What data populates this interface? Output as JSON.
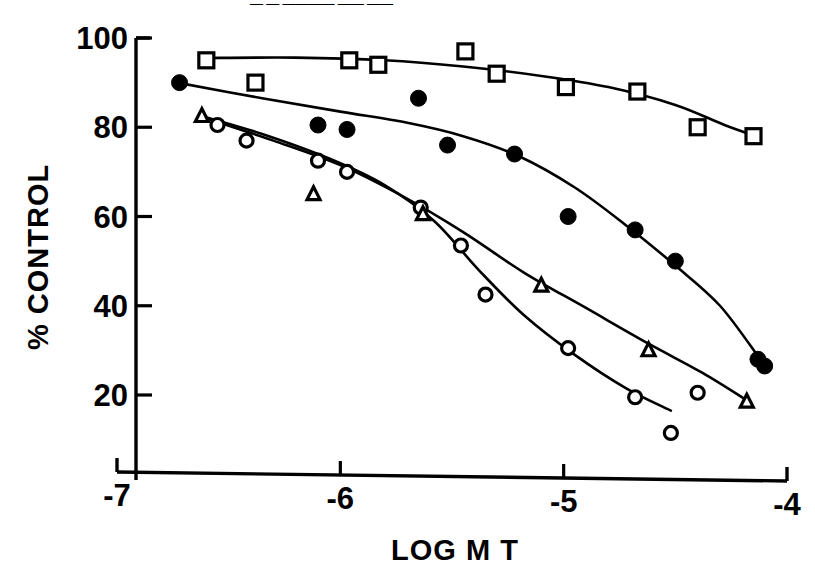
{
  "figure": {
    "top_caption": "— —  ————  ——  ——",
    "background_color": "#ffffff",
    "ink_color": "#000000"
  },
  "chart_data": {
    "type": "scatter",
    "title": "",
    "subtitle": "",
    "xlabel": "LOG M   T",
    "ylabel": "% CONTROL",
    "xlim": [
      -7.0,
      -4.0
    ],
    "ylim": [
      0,
      100
    ],
    "xticks": [
      -7,
      -6,
      -5,
      -4
    ],
    "xtick_labels": [
      "-7",
      "-6",
      "-5",
      "-4"
    ],
    "yticks": [
      20,
      40,
      60,
      80,
      100
    ],
    "ytick_labels": [
      "20",
      "40",
      "60",
      "80",
      "100"
    ],
    "grid": false,
    "legend": "none",
    "legend_position": "none",
    "annotations": [],
    "series": [
      {
        "name": "open-square-series",
        "marker": "open-square",
        "marker_size": 15,
        "has_fit_curve": true,
        "points": [
          {
            "x": -6.6,
            "y": 95
          },
          {
            "x": -6.38,
            "y": 90
          },
          {
            "x": -5.96,
            "y": 95
          },
          {
            "x": -5.83,
            "y": 94
          },
          {
            "x": -5.44,
            "y": 97
          },
          {
            "x": -5.3,
            "y": 92
          },
          {
            "x": -4.99,
            "y": 89
          },
          {
            "x": -4.67,
            "y": 88
          },
          {
            "x": -4.4,
            "y": 80
          },
          {
            "x": -4.15,
            "y": 78
          }
        ],
        "curve": [
          {
            "x": -6.62,
            "y": 95.5
          },
          {
            "x": -6.2,
            "y": 95.6
          },
          {
            "x": -5.8,
            "y": 95.0
          },
          {
            "x": -5.45,
            "y": 93.6
          },
          {
            "x": -5.1,
            "y": 91.5
          },
          {
            "x": -4.8,
            "y": 89.0
          },
          {
            "x": -4.5,
            "y": 85.0
          },
          {
            "x": -4.28,
            "y": 80.5
          },
          {
            "x": -4.14,
            "y": 78.0
          }
        ]
      },
      {
        "name": "filled-circle-series",
        "marker": "filled-circle",
        "marker_size": 16,
        "has_fit_curve": true,
        "points": [
          {
            "x": -6.72,
            "y": 90
          },
          {
            "x": -6.1,
            "y": 80.5
          },
          {
            "x": -5.97,
            "y": 79.5
          },
          {
            "x": -5.65,
            "y": 86.5
          },
          {
            "x": -5.52,
            "y": 76
          },
          {
            "x": -5.22,
            "y": 74
          },
          {
            "x": -4.98,
            "y": 60
          },
          {
            "x": -4.68,
            "y": 57
          },
          {
            "x": -4.5,
            "y": 50
          },
          {
            "x": -4.13,
            "y": 28
          },
          {
            "x": -4.1,
            "y": 26.5
          }
        ],
        "curve": [
          {
            "x": -6.73,
            "y": 90.0
          },
          {
            "x": -6.35,
            "y": 86.5
          },
          {
            "x": -6.0,
            "y": 83.5
          },
          {
            "x": -5.7,
            "y": 81.0
          },
          {
            "x": -5.45,
            "y": 78.0
          },
          {
            "x": -5.2,
            "y": 73.5
          },
          {
            "x": -4.95,
            "y": 66.5
          },
          {
            "x": -4.72,
            "y": 58.0
          },
          {
            "x": -4.5,
            "y": 49.0
          },
          {
            "x": -4.3,
            "y": 40.0
          },
          {
            "x": -4.12,
            "y": 28.0
          }
        ]
      },
      {
        "name": "open-circle-series",
        "marker": "open-circle",
        "marker_size": 13,
        "has_fit_curve": true,
        "points": [
          {
            "x": -6.55,
            "y": 80.5
          },
          {
            "x": -6.42,
            "y": 77
          },
          {
            "x": -6.1,
            "y": 72.5
          },
          {
            "x": -5.97,
            "y": 70
          },
          {
            "x": -5.64,
            "y": 62
          },
          {
            "x": -5.46,
            "y": 53.5
          },
          {
            "x": -5.35,
            "y": 42.5
          },
          {
            "x": -4.98,
            "y": 30.5
          },
          {
            "x": -4.68,
            "y": 19.5
          },
          {
            "x": -4.4,
            "y": 20.5
          },
          {
            "x": -4.52,
            "y": 11.5
          }
        ],
        "curve": [
          {
            "x": -6.62,
            "y": 82.5
          },
          {
            "x": -6.35,
            "y": 78.5
          },
          {
            "x": -6.05,
            "y": 73.0
          },
          {
            "x": -5.8,
            "y": 67.0
          },
          {
            "x": -5.58,
            "y": 59.0
          },
          {
            "x": -5.38,
            "y": 48.0
          },
          {
            "x": -5.18,
            "y": 38.0
          },
          {
            "x": -4.95,
            "y": 29.0
          },
          {
            "x": -4.72,
            "y": 21.5
          },
          {
            "x": -4.52,
            "y": 16.5
          }
        ]
      },
      {
        "name": "open-triangle-series",
        "marker": "open-triangle",
        "marker_size": 13,
        "has_fit_curve": true,
        "points": [
          {
            "x": -6.62,
            "y": 82.5
          },
          {
            "x": -6.12,
            "y": 65
          },
          {
            "x": -5.63,
            "y": 60.5
          },
          {
            "x": -5.1,
            "y": 44.5
          },
          {
            "x": -4.62,
            "y": 30
          },
          {
            "x": -4.18,
            "y": 18.5
          }
        ],
        "curve": [
          {
            "x": -6.63,
            "y": 82.5
          },
          {
            "x": -6.3,
            "y": 77.0
          },
          {
            "x": -6.0,
            "y": 71.5
          },
          {
            "x": -5.72,
            "y": 64.5
          },
          {
            "x": -5.45,
            "y": 56.5
          },
          {
            "x": -5.18,
            "y": 47.5
          },
          {
            "x": -4.9,
            "y": 39.5
          },
          {
            "x": -4.62,
            "y": 31.5
          },
          {
            "x": -4.38,
            "y": 25.0
          },
          {
            "x": -4.17,
            "y": 18.5
          }
        ]
      }
    ]
  }
}
